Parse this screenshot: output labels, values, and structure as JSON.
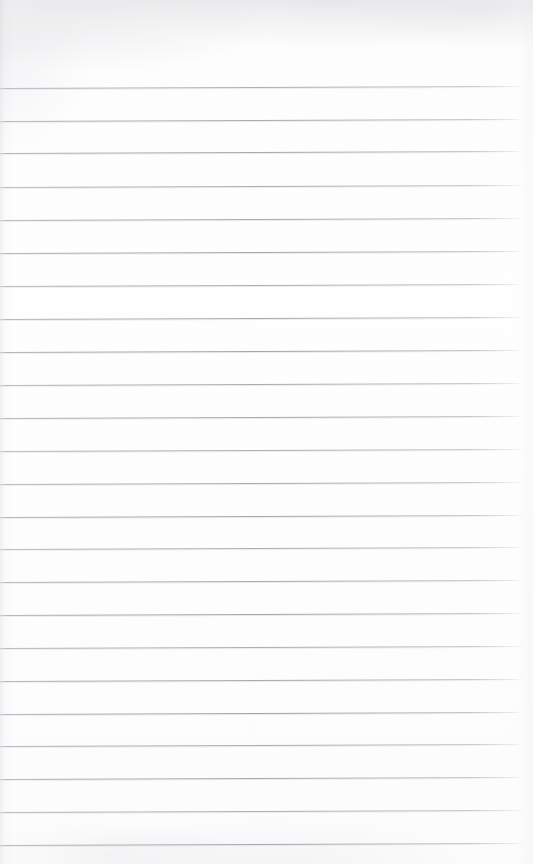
{
  "document": {
    "kind": "scanned-ruled-paper",
    "title": "Blank Lined Notebook Page",
    "description": "A scanned blank sheet of ruled (lined) notebook paper with no handwriting or printed text.",
    "page_width_px": 533,
    "page_height_px": 864,
    "background_color": "#fdfdfd",
    "paper_color": "#ffffff",
    "content_text": "",
    "has_handwriting": false,
    "has_printed_text": false
  },
  "ruling": {
    "line_color": "#a2a6ac",
    "line_thickness_px": 1,
    "line_count": 24,
    "line_spacing_px": 32.7,
    "first_line_y_px": 88,
    "last_line_y_px": 845,
    "line_start_x_px": 0,
    "line_end_x_px": 521,
    "skew_rise_px": -2.0,
    "top_margin_px": 88,
    "bottom_margin_px": 19,
    "has_vertical_margin_rule": false,
    "has_header_rule": false,
    "line_y_positions": [
      88,
      121,
      153,
      187,
      220,
      253,
      286,
      319,
      352,
      385,
      418,
      451,
      484,
      517,
      549,
      582,
      615,
      648,
      681,
      714,
      746,
      779,
      812,
      845
    ]
  },
  "scan_artifacts": {
    "top_edge_shadow": true,
    "top_shadow_color": "#c6c8cc",
    "left_edge_shadow": true,
    "bottom_smudge": true,
    "grain_visible": true,
    "notes": "Faint grey scanner shadow smear along the top edge and a thin darkening at the extreme left margin; lines fade out before the right edge."
  }
}
